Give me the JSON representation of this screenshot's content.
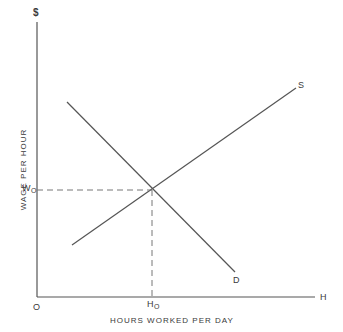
{
  "diagram": {
    "y_axis_symbol": "$",
    "x_axis_symbol": "H",
    "origin_label": "O",
    "y_axis_label": "WAGE PER HOUR",
    "x_axis_label": "HOURS WORKED PER DAY",
    "equilibrium_wage": {
      "main": "W",
      "sub": "O"
    },
    "equilibrium_hours": {
      "main": "H",
      "sub": "O"
    },
    "curves": [
      {
        "name": "Supply",
        "label": "S",
        "from": [
          72,
          245
        ],
        "to": [
          296,
          88
        ]
      },
      {
        "name": "Demand",
        "label": "D",
        "from": [
          67,
          102
        ],
        "to": [
          235,
          272
        ]
      }
    ],
    "equilibrium_point": [
      152,
      190
    ],
    "line_color": "#555555"
  }
}
